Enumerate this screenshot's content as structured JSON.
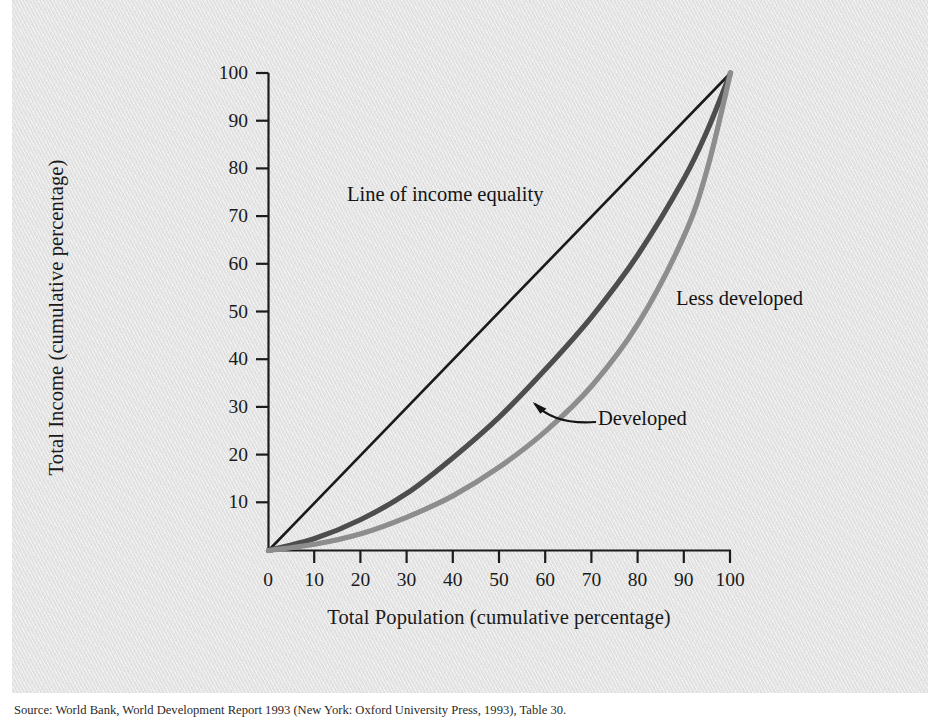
{
  "figure": {
    "background_color": "#e3e3e3",
    "page_color": "#ffffff"
  },
  "axes": {
    "x_title": "Total Population (cumulative percentage)",
    "y_title": "Total Income (cumulative percentage)",
    "x_ticks": [
      "0",
      "10",
      "20",
      "30",
      "40",
      "50",
      "60",
      "70",
      "80",
      "90",
      "100"
    ],
    "y_ticks": [
      "10",
      "20",
      "30",
      "40",
      "50",
      "60",
      "70",
      "80",
      "90",
      "100"
    ]
  },
  "annotations": {
    "equality_line": "Line of income equality",
    "less_developed": "Less developed",
    "developed": "Developed"
  },
  "source": {
    "text": "Source: World Bank, World Development Report 1993 (New York: Oxford University Press, 1993), Table 30."
  },
  "chart_data": {
    "type": "line",
    "title": "",
    "subtitle": "",
    "xlabel": "Total Population (cumulative percentage)",
    "ylabel": "Total Income (cumulative percentage)",
    "xlim": [
      0,
      100
    ],
    "ylim": [
      0,
      100
    ],
    "xticks": [
      0,
      10,
      20,
      30,
      40,
      50,
      60,
      70,
      80,
      90,
      100
    ],
    "yticks": [
      0,
      10,
      20,
      30,
      40,
      50,
      60,
      70,
      80,
      90,
      100
    ],
    "grid": false,
    "legend": "inline-annotations",
    "x": [
      0,
      10,
      20,
      30,
      40,
      50,
      60,
      70,
      80,
      90,
      95,
      100
    ],
    "series": [
      {
        "name": "Line of income equality",
        "color": "#1a1a1a",
        "width": 2.6,
        "values": [
          0,
          10,
          20,
          30,
          40,
          50,
          60,
          70,
          80,
          90,
          95,
          100
        ]
      },
      {
        "name": "Developed",
        "color": "#4d4d4d",
        "width": 5.2,
        "values": [
          0,
          2.5,
          6.5,
          12.0,
          19.5,
          28.0,
          38.0,
          49.0,
          62.0,
          78.0,
          88.0,
          100
        ]
      },
      {
        "name": "Less developed",
        "color": "#8d8d8d",
        "width": 5.2,
        "values": [
          0,
          1.3,
          3.5,
          7.0,
          11.5,
          17.5,
          25.0,
          34.5,
          47.5,
          66.0,
          80.0,
          100
        ]
      }
    ],
    "annotations": [
      {
        "text": "Line of income equality",
        "x": 22,
        "y": 77,
        "points_to": null
      },
      {
        "text": "Less developed",
        "x": 90,
        "y": 55,
        "points_to": null
      },
      {
        "text": "Developed",
        "x": 73,
        "y": 31,
        "points_to": {
          "x": 58,
          "y": 36
        }
      }
    ]
  }
}
